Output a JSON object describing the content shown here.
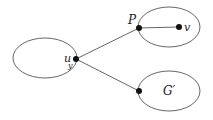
{
  "diagram": {
    "type": "graph",
    "colors": {
      "stroke": "#555555",
      "node": "#111111",
      "text": "#222222",
      "background": "#ffffff"
    },
    "regions": [
      {
        "id": "left-region",
        "cx": 45,
        "cy": 58,
        "rx": 32,
        "ry": 20
      },
      {
        "id": "top-right-region",
        "cx": 169,
        "cy": 27,
        "rx": 31,
        "ry": 20
      },
      {
        "id": "bottom-right-region",
        "cx": 169,
        "cy": 91,
        "rx": 31,
        "ry": 20
      }
    ],
    "nodes": [
      {
        "id": "u",
        "label": "u",
        "sub": "y",
        "x": 76,
        "y": 59
      },
      {
        "id": "P",
        "label": "P",
        "x": 139,
        "y": 28
      },
      {
        "id": "v",
        "label": "v",
        "x": 179,
        "y": 27
      },
      {
        "id": "g",
        "label": "",
        "x": 139,
        "y": 91
      }
    ],
    "edges": [
      {
        "from": "u",
        "to": "P"
      },
      {
        "from": "u",
        "to": "g"
      },
      {
        "from": "P",
        "to": "v"
      }
    ],
    "labels": {
      "u": "u",
      "u_sub": "y",
      "P": "P",
      "v": "v",
      "G_prime": "G′"
    }
  }
}
